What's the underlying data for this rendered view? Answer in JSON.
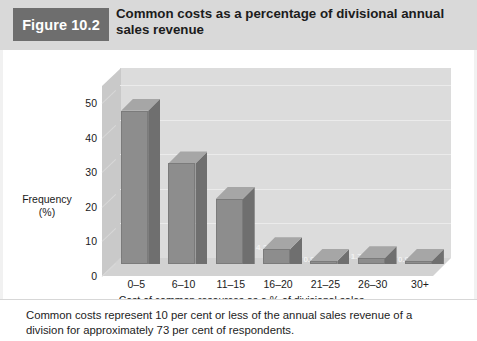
{
  "figure": {
    "number_label": "Figure 10.2",
    "title": "Common costs as a percentage of divisional annual sales revenue",
    "caption": "Common costs represent 10 per cent or less of the annual sales revenue of a division for approximately 73 per cent of respondents."
  },
  "colors": {
    "header_band": "#d9d9d9",
    "figure_number_box": "#6e6e6e",
    "bar_front": "#8d8d8d",
    "bar_side": "#6f6f6f",
    "bar_top": "#a6a6a6",
    "plot_back_wall": "#dcdcdc",
    "plot_floor": "#d2d2d2"
  },
  "chart_data": {
    "type": "bar",
    "title": "Common costs as a percentage of divisional annual sales revenue",
    "xlabel": "Cost of common resources as a % of divisional sales",
    "ylabel": "Frequency (%)",
    "ylabel_lines": [
      "Frequency",
      "(%)"
    ],
    "categories": [
      "0–5",
      "6–10",
      "11–15",
      "16–20",
      "21–25",
      "26–30",
      "30+"
    ],
    "values": [
      44.4,
      29.1,
      18.8,
      4.3,
      0.9,
      1.7,
      0.9
    ],
    "value_labels": [
      "44.4",
      "29.1",
      "18.8",
      "4.3",
      "0.9",
      "1.7",
      "0.9"
    ],
    "yticks": [
      0,
      10,
      20,
      30,
      40,
      50
    ],
    "ytick_labels": [
      "0",
      "10",
      "20",
      "30",
      "40",
      "50"
    ],
    "ylim": [
      0,
      55
    ],
    "grid": true,
    "legend": false,
    "three_d": true
  }
}
